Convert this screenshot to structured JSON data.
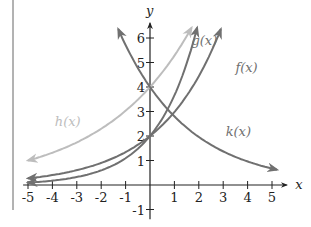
{
  "chart_data": {
    "type": "line",
    "title": "",
    "xlabel": "x",
    "ylabel": "y",
    "xlim": [
      -5,
      5
    ],
    "ylim": [
      -1,
      6
    ],
    "x_ticks": [
      -5,
      -4,
      -3,
      -2,
      -1,
      1,
      2,
      3,
      4,
      5
    ],
    "y_ticks": [
      -1,
      1,
      2,
      3,
      4,
      5,
      6
    ],
    "grid": false,
    "series": [
      {
        "name": "f(x)",
        "formula": "2*1.49^x",
        "color": "#707070",
        "x_range": [
          -5,
          2.9
        ],
        "label_pos": [
          3.5,
          4.6
        ]
      },
      {
        "name": "g(x)",
        "formula": "2*1.83^x",
        "color": "#707070",
        "x_range": [
          -5,
          1.93
        ],
        "label_pos": [
          1.7,
          5.7
        ]
      },
      {
        "name": "h(x)",
        "formula": "4*1.32^x",
        "color": "#bdbdbd",
        "x_range": [
          -5,
          1.7
        ],
        "label_pos": [
          -3.9,
          2.4
        ]
      },
      {
        "name": "k(x)",
        "formula": "4*0.7^x",
        "color": "#707070",
        "x_range": [
          -1.3,
          5.2
        ],
        "label_pos": [
          3.1,
          2.0
        ]
      }
    ]
  }
}
